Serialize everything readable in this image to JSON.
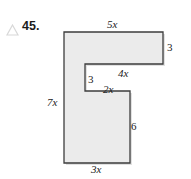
{
  "problem": {
    "number": "45.",
    "marker_icon": "triangle-outline-icon"
  },
  "figure": {
    "name": "composite-rectilinear-polygon",
    "fill_color": "#ebebeb",
    "stroke_color": "#3d3d3d",
    "shadow_color": "#b8b8b8",
    "vertices": [
      [
        64,
        32
      ],
      [
        163,
        32
      ],
      [
        163,
        64
      ],
      [
        85,
        64
      ],
      [
        85,
        91
      ],
      [
        130,
        91
      ],
      [
        130,
        163
      ],
      [
        64,
        163
      ]
    ],
    "labels": {
      "top": "5x",
      "right_upper": "3",
      "inner_horizontal": "4x",
      "inner_vertical": "3",
      "inner_lower": "2x",
      "left": "7x",
      "right_lower": "6",
      "bottom": "3x"
    }
  }
}
